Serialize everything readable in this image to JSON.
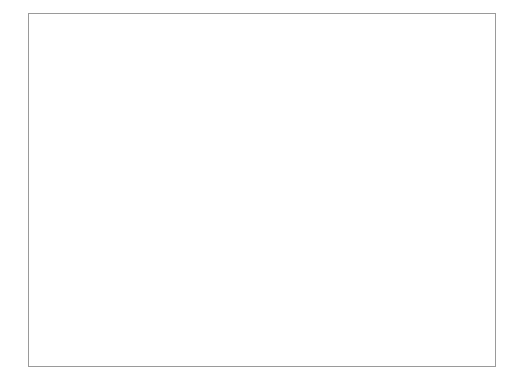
{
  "figure": {
    "has_outer_frame": true,
    "background_color": "#ffffff",
    "frame_color": "#9a9a9a"
  },
  "chart_data": {
    "type": "line",
    "title": "",
    "xlabel": "Year",
    "ylabel": "Percent",
    "xlim": [
      1939,
      1955
    ],
    "ylim": [
      0.0,
      0.8
    ],
    "grid": false,
    "legend_position": "inline-annotation",
    "x_tick_labels": [
      "1940",
      "1942",
      "1944",
      "1946",
      "1948",
      "1950",
      "1952",
      "1954"
    ],
    "x_major_ticks": [
      1940,
      1942,
      1944,
      1946,
      1948,
      1950,
      1952,
      1954
    ],
    "x_minor_ticks": [
      1939,
      1941,
      1943,
      1945,
      1947,
      1949,
      1951,
      1953,
      1955
    ],
    "y_tick_labels": [
      "0.0",
      "0.2",
      "0.4",
      "0.6",
      "0.8"
    ],
    "y_ticks": [
      0.0,
      0.2,
      0.4,
      0.6,
      0.8
    ],
    "x": [
      1939,
      1940,
      1941,
      1942,
      1943,
      1944,
      1945,
      1946,
      1947,
      1948,
      1949,
      1950,
      1951,
      1952,
      1953,
      1954,
      1955
    ],
    "series": [
      {
        "name": "Share of Consumption in GDP",
        "label": "Share of Consumption in GDP",
        "color": "#bdbdbd",
        "line_width": 3.0,
        "values": [
          0.735,
          0.715,
          0.7,
          0.64,
          0.56,
          0.52,
          0.515,
          0.515,
          0.585,
          0.655,
          0.67,
          0.65,
          0.66,
          0.625,
          0.645,
          0.63,
          0.628
        ],
        "annotation": {
          "text": "Share of Consumption in GDP",
          "text_x": 1941.2,
          "text_y": 0.755,
          "leader_from_x": 1941.0,
          "leader_from_y": 0.742,
          "leader_to_x": 1940.4,
          "leader_to_y": 0.69
        }
      },
      {
        "name": "Share of Government Spending in GDP",
        "label": "Share of Government Spending in GDP",
        "color": "#6e6e6e",
        "line_width": 3.0,
        "values": [
          0.15,
          0.145,
          0.142,
          0.245,
          0.4,
          0.462,
          0.462,
          0.425,
          0.21,
          0.128,
          0.14,
          0.155,
          0.14,
          0.175,
          0.222,
          0.208,
          0.18
        ],
        "annotation": {
          "text": "Share of Government Spending in GDP",
          "text_x": 1941.1,
          "text_y": 0.055,
          "leader_from_x": 1940.9,
          "leader_from_y": 0.072,
          "leader_to_x": 1940.3,
          "leader_to_y": 0.132
        }
      }
    ]
  }
}
